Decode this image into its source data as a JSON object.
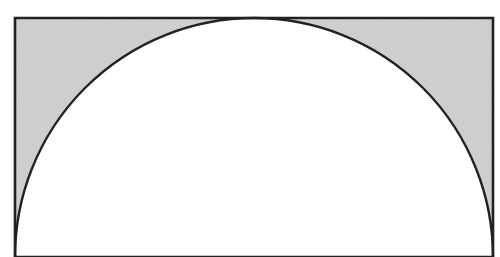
{
  "figure": {
    "shapes": [
      "rectangle",
      "semicircle"
    ],
    "colors": {
      "shaded_region": "#d4d4d4",
      "stroke": "#222222",
      "background": "#ffffff",
      "semicircle_fill": "#ffffff"
    }
  }
}
